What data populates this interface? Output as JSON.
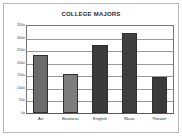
{
  "chart_data": {
    "type": "bar",
    "title": "COLLEGE MAJORS",
    "xlabel": "",
    "ylabel": "",
    "categories": [
      "Art",
      "Business",
      "English",
      "Music",
      "Theater"
    ],
    "values": [
      230,
      155,
      270,
      320,
      145
    ],
    "ylim": [
      0,
      350
    ],
    "yticks": [
      0,
      50,
      100,
      150,
      200,
      250,
      300,
      350
    ],
    "ytick_labels": [
      "0",
      "50",
      "100",
      "150",
      "200",
      "250",
      "300",
      "350"
    ],
    "grid": true,
    "legend": "none",
    "bar_colors": [
      "#6b6b6b",
      "#7d7d7d",
      "#3a3a3a",
      "#3f3f3f",
      "#3a3a3a"
    ],
    "bar_border_color": "#2f2f2f",
    "gridline_color": "#9a9a9a",
    "axis_color": "#767676",
    "plot_background": "#ffffff",
    "frame_border_color": "#b9b9b9",
    "title_color": "#2b2b2b"
  }
}
